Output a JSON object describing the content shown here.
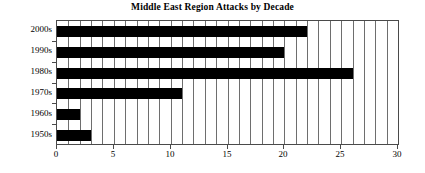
{
  "chart_data": {
    "type": "bar",
    "orientation": "horizontal",
    "title": "Middle East Region Attacks by Decade",
    "xlabel": "",
    "ylabel": "",
    "categories": [
      "2000s",
      "1990s",
      "1980s",
      "1970s",
      "1960s",
      "1950s"
    ],
    "values": [
      22,
      20,
      26,
      11,
      2,
      3
    ],
    "xlim": [
      0,
      30
    ],
    "xticks": [
      0,
      5,
      10,
      15,
      20,
      25,
      30
    ],
    "xtick_labels": [
      "0",
      "5",
      "10",
      "15",
      "20",
      "25",
      "30"
    ],
    "minor_gridlines_every": 1,
    "grid": true,
    "legend": false,
    "bar_color": "#000000",
    "grid_color": "#6e6e6e",
    "axis_color": "#4a4a4a",
    "background": "#ffffff"
  }
}
